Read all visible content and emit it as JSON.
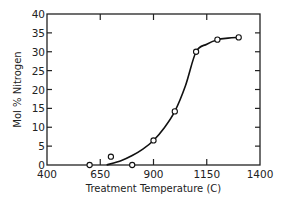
{
  "chart_data": {
    "type": "scatter",
    "title": "",
    "xlabel": "Treatment Temperature (C)",
    "ylabel": "Mol % Nitrogen",
    "xlim": [
      400,
      1400
    ],
    "ylim": [
      0,
      40
    ],
    "x_ticks": [
      400,
      650,
      900,
      1150,
      1400
    ],
    "y_ticks": [
      0,
      5,
      10,
      15,
      20,
      25,
      30,
      35,
      40
    ],
    "grid": false,
    "legend": null,
    "series": [
      {
        "name": "measured",
        "marker": "open-circle",
        "x": [
          600,
          700,
          800,
          900,
          1000,
          1100,
          1200,
          1300
        ],
        "y": [
          0,
          2.2,
          0,
          6.5,
          14.2,
          30,
          33.2,
          33.8
        ]
      },
      {
        "name": "fitted-curve",
        "style": "solid-line",
        "x": [
          680,
          750,
          800,
          850,
          900,
          950,
          1000,
          1050,
          1100,
          1150,
          1200,
          1250,
          1300
        ],
        "y": [
          0,
          1.2,
          2.5,
          4.2,
          6.5,
          9.8,
          14.2,
          21,
          30,
          32,
          33.2,
          33.6,
          33.8
        ]
      }
    ]
  }
}
